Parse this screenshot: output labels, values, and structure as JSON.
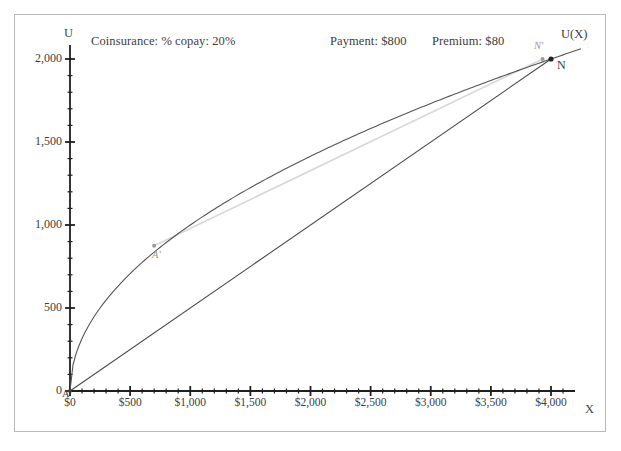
{
  "chart_data": {
    "type": "line",
    "title": "",
    "xlabel": "X",
    "ylabel": "U",
    "xlim": [
      0,
      4250
    ],
    "ylim": [
      0,
      2100
    ],
    "grid": false,
    "legend": "none",
    "x_ticks": [
      "$0",
      "$500",
      "$1,000",
      "$1,500",
      "$2,000",
      "$2,500",
      "$3,000",
      "$3,500",
      "$4,000"
    ],
    "x_tick_values": [
      0,
      500,
      1000,
      1500,
      2000,
      2500,
      3000,
      3500,
      4000
    ],
    "y_ticks": [
      "0",
      "500",
      "1,000",
      "1,500",
      "2,000"
    ],
    "y_tick_values": [
      0,
      500,
      1000,
      1500,
      2000
    ],
    "x_minor_step": 100,
    "y_minor_step": 100,
    "annotations": [
      {
        "name": "coinsurance",
        "text": "Coinsurance: % copay: 20%"
      },
      {
        "name": "payment",
        "text": "Payment: $800"
      },
      {
        "name": "premium",
        "text": "Premium: $80"
      }
    ],
    "series": [
      {
        "name": "U(X)",
        "type": "curve",
        "label": "U(X)",
        "color": "#555555",
        "description": "Concave utility curve U(X) = 2000*(X/4000)^0.5 style square-root shape from origin A to N",
        "points": [
          [
            0,
            0
          ],
          [
            50,
            230
          ],
          [
            100,
            330
          ],
          [
            150,
            405
          ],
          [
            200,
            467
          ],
          [
            300,
            572
          ],
          [
            400,
            661
          ],
          [
            500,
            739
          ],
          [
            600,
            810
          ],
          [
            700,
            875
          ],
          [
            800,
            935
          ],
          [
            900,
            992
          ],
          [
            1000,
            1045
          ],
          [
            1200,
            1145
          ],
          [
            1400,
            1236
          ],
          [
            1600,
            1322
          ],
          [
            1800,
            1402
          ],
          [
            2000,
            1478
          ],
          [
            2200,
            1550
          ],
          [
            2400,
            1619
          ],
          [
            2600,
            1685
          ],
          [
            2800,
            1749
          ],
          [
            3000,
            1811
          ],
          [
            3200,
            1870
          ],
          [
            3400,
            1928
          ],
          [
            3600,
            1984
          ],
          [
            3800,
            2038
          ],
          [
            4000,
            2000
          ],
          [
            4250,
            2090
          ]
        ]
      },
      {
        "name": "chord-A-N",
        "type": "line",
        "color": "#4a4a4a",
        "description": "Straight chord from A at origin to N at the end of the utility curve",
        "points": [
          [
            0,
            0
          ],
          [
            4000,
            2000
          ]
        ]
      },
      {
        "name": "line-Aprime-Nprime",
        "type": "line",
        "color": "#d8d8d8",
        "description": "Light grey line from A' on the curve to N' near the curve end",
        "points": [
          [
            700,
            875
          ],
          [
            3930,
            2000
          ]
        ]
      }
    ],
    "points": [
      {
        "name": "A",
        "label": "A",
        "x": 0,
        "y": 0,
        "color": "#3d3d3d"
      },
      {
        "name": "A-prime",
        "label": "A'",
        "x": 700,
        "y": 875,
        "color": "#9a9a9a"
      },
      {
        "name": "N",
        "label": "N",
        "x": 4000,
        "y": 2000,
        "color": "#222222"
      },
      {
        "name": "N-prime",
        "label": "N'",
        "x": 3930,
        "y": 2000,
        "color": "#9a9a9a"
      }
    ]
  }
}
